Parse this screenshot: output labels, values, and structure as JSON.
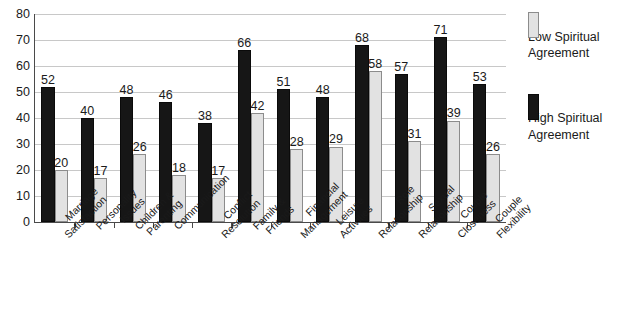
{
  "chart_data": {
    "type": "bar",
    "title": "",
    "xlabel": "",
    "ylabel": "",
    "ylim": [
      0,
      80
    ],
    "ytick_step": 10,
    "yticks": [
      80,
      70,
      60,
      50,
      40,
      30,
      20,
      10,
      0
    ],
    "grid": true,
    "legend_position": "right",
    "categories": [
      "Marriage Satisfaction",
      "Personality Issues",
      "Children & Parenting",
      "Communication",
      "Conflict Resolution",
      "Family & Friends",
      "Financial Management",
      "Leisure Activities",
      "Role Relationship",
      "Sexual Relationship",
      "Couple Closeness",
      "Couple Flexibility"
    ],
    "category_lines": [
      [
        "Marriage",
        "Satisfaction"
      ],
      [
        "Personality",
        "Issues"
      ],
      [
        "Children &",
        "Parenting"
      ],
      [
        "Communication"
      ],
      [
        "Conflict",
        "Resolution"
      ],
      [
        "Family &",
        "Friends"
      ],
      [
        "Financial",
        "Management"
      ],
      [
        "Leisure",
        "Activities"
      ],
      [
        "Role",
        "Relationship"
      ],
      [
        "Sexual",
        "Relationship"
      ],
      [
        "Couple",
        "Closeness"
      ],
      [
        "Couple",
        "Flexibility"
      ]
    ],
    "series": [
      {
        "name": "High Spiritual Agreement",
        "color": "#161616",
        "values": [
          52,
          40,
          48,
          46,
          38,
          66,
          51,
          48,
          68,
          57,
          71,
          53
        ]
      },
      {
        "name": "Low Spiritual Agreement",
        "color": "#e2e2e2",
        "values": [
          20,
          17,
          26,
          18,
          17,
          42,
          28,
          29,
          58,
          31,
          39,
          26
        ]
      }
    ]
  },
  "legend": {
    "items": [
      {
        "label": "Low Spiritual Agreement",
        "line1": "Low Spiritual",
        "line2": "Agreement",
        "swatch": "low-spiritual-agreement-swatch",
        "color": "#e2e2e2"
      },
      {
        "label": "High Spiritual Agreement",
        "line1": "High Spiritual",
        "line2": "Agreement",
        "swatch": "high-spiritual-agreement-swatch",
        "color": "#161616"
      }
    ]
  }
}
